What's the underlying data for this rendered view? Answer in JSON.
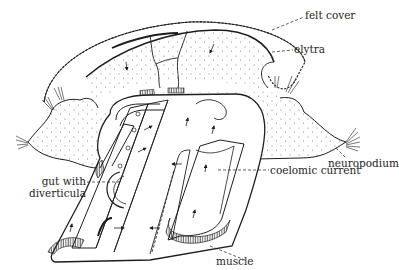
{
  "diagram": {
    "type": "anatomical cross-section line drawing",
    "colors": {
      "ink": "#1e1e1e",
      "background": "#ffffff",
      "stipple": "#6a6a6a"
    },
    "labels": [
      {
        "id": "felt-cover",
        "text": "felt cover"
      },
      {
        "id": "elytra",
        "text": "elytra"
      },
      {
        "id": "neuropodium",
        "text": "neuropodium"
      },
      {
        "id": "coelomic-current",
        "text": "coelomic current"
      },
      {
        "id": "gut-with-diverticula",
        "line1": "gut with",
        "line2": "diverticula"
      },
      {
        "id": "muscle",
        "text": "muscle"
      }
    ]
  }
}
